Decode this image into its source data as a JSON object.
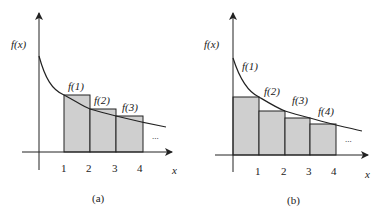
{
  "colors": {
    "bar_fill": "#cfcfcf",
    "stroke": "#222222",
    "background": "#ffffff"
  },
  "panels": [
    {
      "id": "a",
      "caption": "(a)",
      "y_label": "f(x)",
      "x_label": "x",
      "ticks": [
        "1",
        "2",
        "3",
        "4"
      ],
      "bar_labels": [
        "f(1)",
        "f(2)",
        "f(3)"
      ],
      "ellipsis": "...",
      "description": "Rectangles of width 1 from x=1 to x=4 with heights f(1), f(2), f(3); curve lies below rectangle tops (left endpoint sum)"
    },
    {
      "id": "b",
      "caption": "(b)",
      "y_label": "f(x)",
      "x_label": "x",
      "ticks": [
        "1",
        "2",
        "3",
        "4"
      ],
      "bar_labels": [
        "f(1)",
        "f(2)",
        "f(3)",
        "f(4)"
      ],
      "ellipsis": "...",
      "description": "Rectangles of width 1 from x=0 to x=4 with heights f(1), f(2), f(3), f(4); curve lies above rectangle tops (right endpoint sum)"
    }
  ]
}
